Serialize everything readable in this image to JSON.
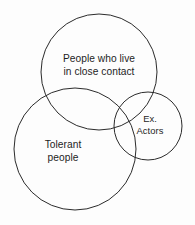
{
  "diagram": {
    "type": "venn",
    "kind": "three-set-venn-diagram",
    "background_color": "#fdfdfd",
    "stroke_color": "#2b2b2b",
    "text_color": "#1d1d1d",
    "sets": [
      {
        "id": "close-contact",
        "label": "People who live\nin close contact",
        "label_line_1": "People who live",
        "label_line_2": "in close contact",
        "center_x": 99,
        "center_y": 72,
        "radius": 58
      },
      {
        "id": "tolerant",
        "label": "Tolerant\npeople",
        "label_line_1": "Tolerant",
        "label_line_2": "people",
        "center_x": 75,
        "center_y": 149,
        "radius": 61
      },
      {
        "id": "ex-actors",
        "label": "Ex.\nActors",
        "label_line_1": "Ex.",
        "label_line_2": "Actors",
        "center_x": 148,
        "center_y": 126,
        "radius": 34
      }
    ]
  }
}
